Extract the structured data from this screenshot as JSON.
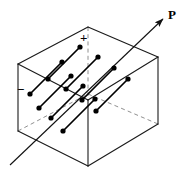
{
  "figure": {
    "background_color": "#ffffff",
    "stroke_color": "#1a1a1a",
    "dot_color": "#000000",
    "hidden_edge_color": "#8a8a8a",
    "width": 191,
    "height": 181
  },
  "labels": [
    {
      "id": "p-vector-label",
      "text": "P",
      "x": 168,
      "y": 8,
      "font_size": 13,
      "bold": true,
      "meaning": "polarization vector"
    },
    {
      "id": "positive-charge-label",
      "text": "+",
      "x": 80,
      "y": 31,
      "font_size": 13,
      "bold": true,
      "meaning": "positive end of dipole"
    },
    {
      "id": "negative-charge-label",
      "text": "−",
      "x": 17,
      "y": 83,
      "font_size": 13,
      "bold": true,
      "meaning": "negative end of dipole"
    }
  ],
  "cube": {
    "description": "Transparent rectangular block drawn in oblique projection",
    "vertices": {
      "top_back": [
        88,
        27
      ],
      "top_left": [
        18,
        64
      ],
      "top_right": [
        158,
        57
      ],
      "top_front": [
        88,
        100
      ],
      "bottom_left": [
        18,
        131
      ],
      "bottom_right": [
        158,
        124
      ],
      "bottom_front": [
        88,
        166
      ],
      "bottom_back": [
        88,
        94
      ]
    },
    "solid_edges": [
      {
        "name": "top-back-left",
        "from": [
          88,
          27
        ],
        "to": [
          18,
          64
        ]
      },
      {
        "name": "top-back-right",
        "from": [
          88,
          27
        ],
        "to": [
          158,
          57
        ]
      },
      {
        "name": "top-front-left",
        "from": [
          18,
          64
        ],
        "to": [
          88,
          100
        ]
      },
      {
        "name": "top-front-right",
        "from": [
          88,
          100
        ],
        "to": [
          158,
          57
        ]
      },
      {
        "name": "vertical-left",
        "from": [
          18,
          64
        ],
        "to": [
          18,
          131
        ]
      },
      {
        "name": "vertical-front",
        "from": [
          88,
          100
        ],
        "to": [
          88,
          166
        ]
      },
      {
        "name": "vertical-right",
        "from": [
          158,
          57
        ],
        "to": [
          158,
          124
        ]
      },
      {
        "name": "bottom-front-left",
        "from": [
          18,
          131
        ],
        "to": [
          88,
          166
        ]
      },
      {
        "name": "bottom-front-right",
        "from": [
          88,
          166
        ],
        "to": [
          158,
          124
        ]
      }
    ],
    "hidden_edges": [
      {
        "name": "vertical-back",
        "from": [
          88,
          27
        ],
        "to": [
          88,
          100
        ]
      },
      {
        "name": "bottom-back-left",
        "from": [
          18,
          131
        ],
        "to": [
          88,
          94
        ]
      },
      {
        "name": "bottom-back-right",
        "from": [
          88,
          94
        ],
        "to": [
          158,
          124
        ]
      }
    ]
  },
  "polarization_vector": {
    "name": "P",
    "description": "Long arrow passing through the block from lower-left to upper-right",
    "tail": [
      10,
      165
    ],
    "head": [
      165,
      17
    ],
    "arrowhead_size": 9,
    "stroke_width": 1.1
  },
  "dipoles": {
    "count": 8,
    "description": "Parallel dipole segments each with a dot at both ends, aligned with P",
    "segments": [
      {
        "id": "dipole-1",
        "from": [
          30,
          94
        ],
        "to": [
          62,
          62
        ]
      },
      {
        "id": "dipole-2",
        "from": [
          39,
          108
        ],
        "to": [
          71,
          76
        ]
      },
      {
        "id": "dipole-3",
        "from": [
          51,
          118
        ],
        "to": [
          83,
          86
        ]
      },
      {
        "id": "dipole-4",
        "from": [
          63,
          131
        ],
        "to": [
          95,
          99
        ]
      },
      {
        "id": "dipole-5",
        "from": [
          48,
          79
        ],
        "to": [
          80,
          47
        ]
      },
      {
        "id": "dipole-6",
        "from": [
          66,
          89
        ],
        "to": [
          98,
          57
        ]
      },
      {
        "id": "dipole-7",
        "from": [
          82,
          100
        ],
        "to": [
          114,
          68
        ]
      },
      {
        "id": "dipole-8",
        "from": [
          96,
          111
        ],
        "to": [
          128,
          79
        ]
      }
    ],
    "dot_radius": 2.6,
    "stroke_width": 1.6
  }
}
